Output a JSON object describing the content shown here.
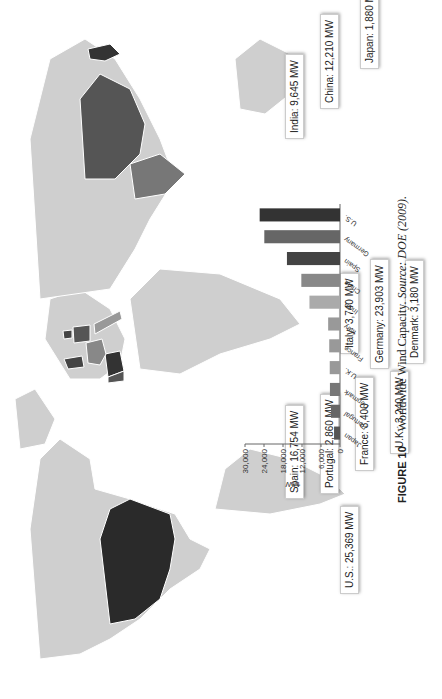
{
  "figure": {
    "number_label": "FIGURE 10",
    "caption_text": "Worldwide Wind Capacity.",
    "source_label": "Source:",
    "source_text": "DOE (2009)."
  },
  "map_labels": [
    {
      "country": "U.S.",
      "text": "U.S.: 25,369 MW"
    },
    {
      "country": "U.K.",
      "text": "U.K.: 3,240 MW"
    },
    {
      "country": "France",
      "text": "France: 3,400 MW"
    },
    {
      "country": "Portugal",
      "text": "Portugal: 2,860 MW"
    },
    {
      "country": "Spain",
      "text": "Spain: 16,754 MW"
    },
    {
      "country": "Denmark",
      "text": "Denmark: 3,180 MW"
    },
    {
      "country": "Germany",
      "text": "Germany: 23,903 MW"
    },
    {
      "country": "Italy",
      "text": "Italy: 3,740 MW"
    },
    {
      "country": "India",
      "text": "India: 9,645 MW"
    },
    {
      "country": "China",
      "text": "China: 12,210 MW"
    },
    {
      "country": "Japan",
      "text": "Japan: 1,880 MW"
    }
  ],
  "chart_data": {
    "type": "bar",
    "title": "",
    "xlabel": "",
    "ylabel": "MW",
    "ylim": [
      0,
      30000
    ],
    "yticks": [
      "0",
      "6,000",
      "12,000",
      "18,000",
      "24,000",
      "30,000"
    ],
    "categories": [
      "Japan",
      "Portugal",
      "Denmark",
      "U.K.",
      "France",
      "Italy",
      "India",
      "China",
      "Spain",
      "Germany",
      "U.S."
    ],
    "values": [
      1880,
      2860,
      3180,
      3240,
      3400,
      3740,
      9645,
      12210,
      16754,
      23903,
      25369
    ],
    "colors": [
      "#555555",
      "#666666",
      "#777777",
      "#999999",
      "#999999",
      "#999999",
      "#aaaaaa",
      "#888888",
      "#444444",
      "#666666",
      "#333333"
    ],
    "grid": false,
    "legend": "none"
  }
}
